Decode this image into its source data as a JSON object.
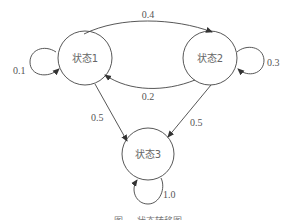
{
  "diagram": {
    "type": "state-transition",
    "nodes": [
      {
        "id": "s1",
        "label": "状态1"
      },
      {
        "id": "s2",
        "label": "状态2"
      },
      {
        "id": "s3",
        "label": "状态3"
      }
    ],
    "edges": [
      {
        "from": "s1",
        "to": "s1",
        "label": "0.1"
      },
      {
        "from": "s1",
        "to": "s2",
        "label": "0.4"
      },
      {
        "from": "s1",
        "to": "s3",
        "label": "0.5"
      },
      {
        "from": "s2",
        "to": "s1",
        "label": "0.2"
      },
      {
        "from": "s2",
        "to": "s2",
        "label": "0.3"
      },
      {
        "from": "s2",
        "to": "s3",
        "label": "0.5"
      },
      {
        "from": "s3",
        "to": "s3",
        "label": "1.0"
      }
    ],
    "caption": "图 … 状态转移图"
  }
}
